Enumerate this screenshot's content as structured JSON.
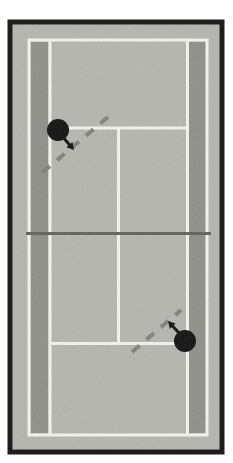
{
  "figure": {
    "type": "tennis-court-diagram",
    "view": "top-down"
  },
  "canvas": {
    "width": 233,
    "height": 463
  },
  "colors": {
    "page": "#ffffff",
    "frame": "#1d1d1d",
    "surface": "#b5b5b0",
    "alley": "#8e8e89",
    "line": "#f4f4f0",
    "net": "#5f5f5b",
    "dash": "#7c7c76",
    "marker": "#0e0e0e"
  },
  "frame": {
    "x": 10,
    "y": 22,
    "w": 212,
    "h": 430,
    "border": 5
  },
  "court": {
    "x": 29,
    "y": 40,
    "w": 178,
    "h": 395,
    "line_width": 3
  },
  "alleys": [
    {
      "id": "left",
      "x": 31,
      "y": 42,
      "w": 17,
      "h": 391
    },
    {
      "id": "right",
      "x": 189,
      "y": 42,
      "w": 17,
      "h": 391
    }
  ],
  "singles_sidelines": [
    {
      "id": "left",
      "x": 50,
      "y1": 40,
      "y2": 435
    },
    {
      "id": "right",
      "x": 187.5,
      "y1": 40,
      "y2": 435
    }
  ],
  "service_lines": [
    {
      "id": "top",
      "y": 128,
      "x1": 50,
      "x2": 188
    },
    {
      "id": "bottom",
      "y": 343.5,
      "x1": 50,
      "x2": 188
    }
  ],
  "center_service_line": {
    "x": 118.5,
    "y1": 128,
    "y2": 343.5
  },
  "net": {
    "y": 233.5,
    "x1": 26,
    "x2": 211,
    "width": 3
  },
  "players": [
    {
      "id": "top",
      "cx": 58,
      "cy": 130,
      "r": 11,
      "arrow": {
        "from": [
          62,
          136
        ],
        "to": [
          74,
          150
        ]
      }
    },
    {
      "id": "bottom",
      "cx": 185,
      "cy": 341,
      "r": 11,
      "arrow": {
        "from": [
          179,
          333
        ],
        "to": [
          168,
          321
        ]
      }
    }
  ],
  "trajectories": [
    {
      "id": "top-shot",
      "x1": 108,
      "y1": 117,
      "x2": 36,
      "y2": 178
    },
    {
      "id": "bottom-shot",
      "x1": 132,
      "y1": 352,
      "x2": 181,
      "y2": 310
    }
  ],
  "dash_style": {
    "pattern": "10 9",
    "width": 4
  }
}
